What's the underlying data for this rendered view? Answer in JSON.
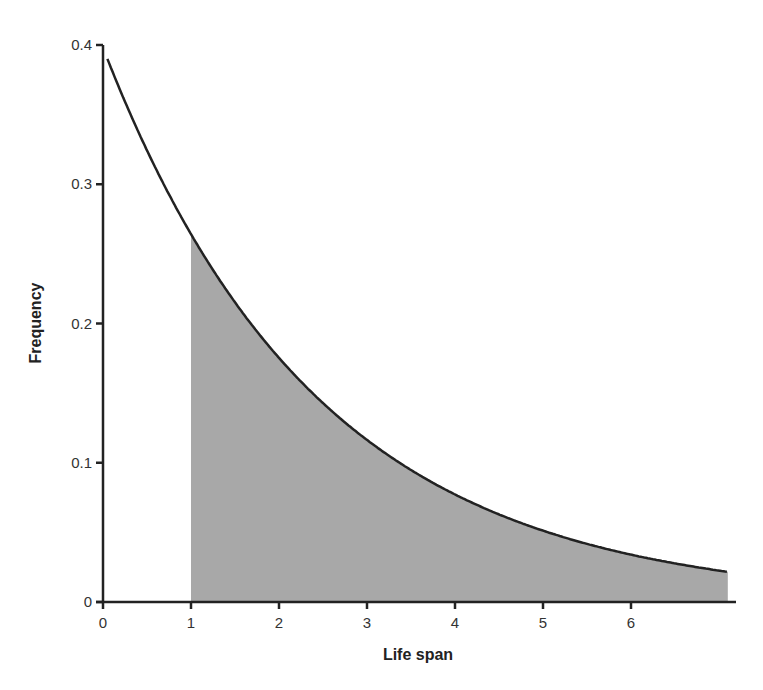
{
  "chart_data": {
    "type": "area",
    "title": "",
    "xlabel": "Life span",
    "ylabel": "Frequency",
    "xlim": [
      0,
      7.1
    ],
    "ylim": [
      0,
      0.4
    ],
    "grid": false,
    "legend": null,
    "x_ticks": [
      "0",
      "1",
      "2",
      "3",
      "4",
      "5",
      "6"
    ],
    "y_ticks": [
      "0",
      "0.1",
      "0.2",
      "0.3",
      "0.4"
    ],
    "series": [
      {
        "name": "exponential density curve",
        "x": [
          0.05,
          0.5,
          1,
          1.5,
          2,
          2.5,
          3,
          3.5,
          4,
          4.5,
          5,
          5.5,
          6,
          6.5,
          7.1
        ],
        "y": [
          0.39,
          0.325,
          0.268,
          0.22,
          0.18,
          0.147,
          0.12,
          0.099,
          0.081,
          0.067,
          0.055,
          0.045,
          0.037,
          0.031,
          0.025
        ]
      }
    ],
    "shaded_region": {
      "from_x": 1,
      "to_x": 7.1,
      "color": "#a8a8a8",
      "description": "area under curve for life span > 1"
    }
  }
}
